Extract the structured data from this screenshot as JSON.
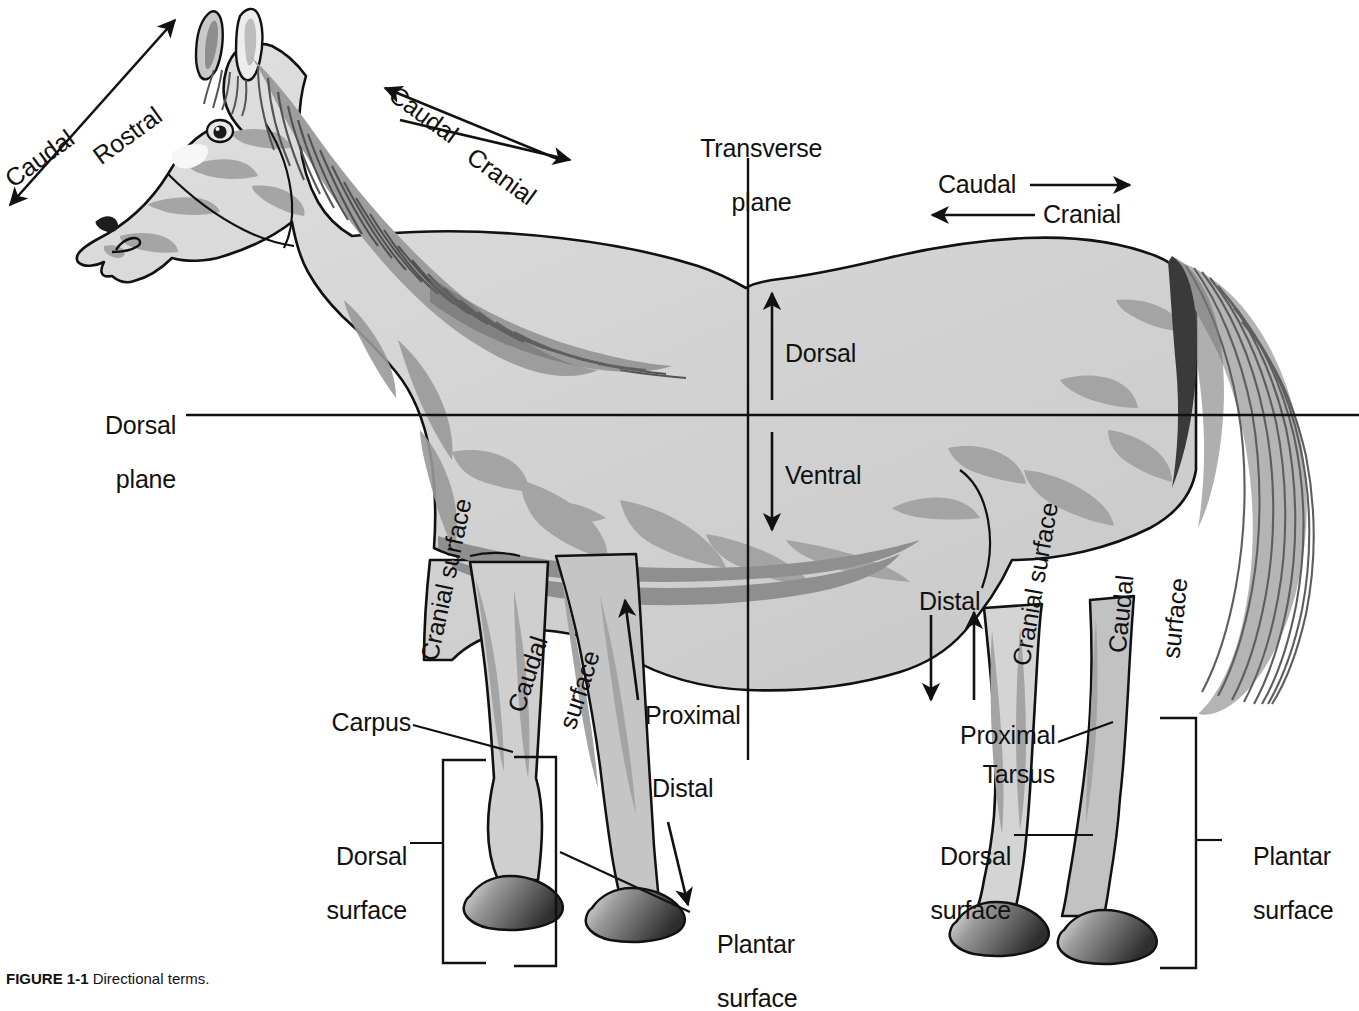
{
  "figure": {
    "caption_label": "FIGURE 1-1",
    "caption_text": "Directional terms."
  },
  "colors": {
    "ink": "#111111",
    "body_light": "#d8d8d8",
    "body_mid": "#a8a8a8",
    "body_shadow": "#8c8c8c",
    "mane_dark": "#5a5a5a",
    "hoof_dark": "#3a3a3a",
    "white": "#ffffff"
  },
  "planes": {
    "transverse": {
      "label_line1": "Transverse",
      "label_line2": "plane"
    },
    "dorsal": {
      "label_line1": "Dorsal",
      "label_line2": "plane"
    }
  },
  "axes": {
    "dorsal": "Dorsal",
    "ventral": "Ventral"
  },
  "head_axis": {
    "caudal": "Caudal",
    "rostral": "Rostral"
  },
  "neck_axis": {
    "caudal": "Caudal",
    "cranial": "Cranial"
  },
  "trunk_axis": {
    "caudal": "Caudal",
    "cranial": "Cranial"
  },
  "forelimb": {
    "cranial_surface": "Cranial surface",
    "caudal_surface_line1": "Caudal",
    "caudal_surface_line2": "surface",
    "carpus": "Carpus",
    "dorsal_surface_line1": "Dorsal",
    "dorsal_surface_line2": "surface",
    "proximal": "Proximal",
    "distal": "Distal",
    "plantar_surface_line1": "Plantar",
    "plantar_surface_line2": "surface"
  },
  "hindlimb": {
    "distal": "Distal",
    "proximal": "Proximal",
    "cranial_surface": "Cranial surface",
    "caudal_surface_line1": "Caudal",
    "caudal_surface_line2": "surface",
    "tarsus": "Tarsus",
    "dorsal_surface_line1": "Dorsal",
    "dorsal_surface_line2": "surface",
    "plantar_surface_line1": "Plantar",
    "plantar_surface_line2": "surface"
  }
}
